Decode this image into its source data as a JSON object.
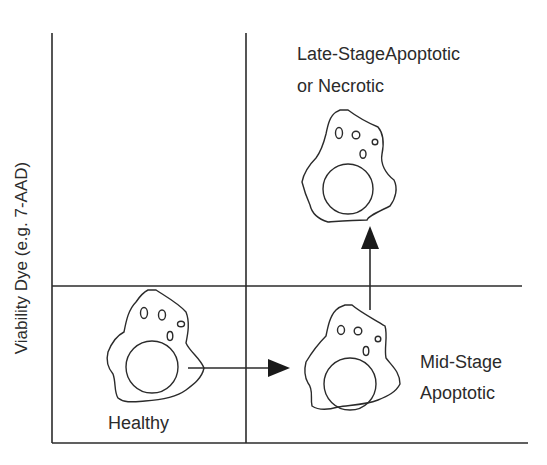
{
  "diagram": {
    "title": "",
    "y_axis_label": "Viability Dye (e.g. 7-AAD)",
    "quadrants": {
      "lower_left": {
        "label": "Healthy"
      },
      "lower_right": {
        "label_line1": "Mid-Stage",
        "label_line2": "Apoptotic"
      },
      "upper_right": {
        "label_line1": "Late-StageApoptotic",
        "label_line2": "or Necrotic"
      },
      "upper_left": {
        "label": ""
      }
    },
    "arrows": [
      {
        "from": "Healthy",
        "to": "Mid-Stage Apoptotic",
        "direction": "right"
      },
      {
        "from": "Mid-Stage Apoptotic",
        "to": "Late-Stage Apoptotic or Necrotic",
        "direction": "up"
      }
    ],
    "colors": {
      "line": "#2b2b2b",
      "background": "#ffffff"
    }
  }
}
